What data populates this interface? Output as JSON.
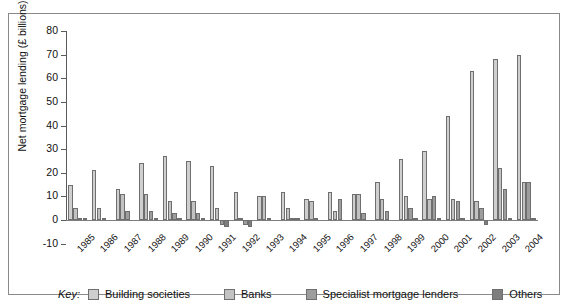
{
  "chart_data": {
    "type": "bar",
    "title": "",
    "xlabel": "",
    "ylabel": "Net mortgage lending (£ billions)",
    "ylim": [
      -10,
      80
    ],
    "yticks": [
      -10,
      0,
      10,
      20,
      30,
      40,
      50,
      60,
      70,
      80
    ],
    "ytick_labels": [
      "-10",
      "0",
      "10",
      "20",
      "30",
      "40",
      "50",
      "60",
      "70",
      "80"
    ],
    "grid": false,
    "legend_position": "bottom",
    "legend_title": "Key:",
    "categories": [
      "1985",
      "1986",
      "1987",
      "1988",
      "1989",
      "1990",
      "1991",
      "1992",
      "1993",
      "1994",
      "1995",
      "1996",
      "1997",
      "1998",
      "1999",
      "2000",
      "2001",
      "2002",
      "2003",
      "2004"
    ],
    "series": [
      {
        "name": "Building societies",
        "color": "#cfcfcf",
        "values": [
          15,
          21,
          13,
          24,
          27,
          25,
          23,
          12,
          10,
          12,
          9,
          12,
          11,
          16,
          26,
          29,
          44,
          63,
          68,
          70
        ]
      },
      {
        "name": "Banks",
        "color": "#c2c2c2",
        "values": [
          5,
          5,
          11,
          11,
          8,
          8,
          5,
          1,
          10,
          5,
          8,
          4,
          11,
          9,
          10,
          9,
          9,
          8,
          22,
          16
        ]
      },
      {
        "name": "Specialist mortgage lenders",
        "color": "#9d9d9d",
        "values": [
          1,
          1,
          4,
          4,
          3,
          3,
          -2,
          -2,
          1,
          1,
          1,
          9,
          3,
          4,
          5,
          10,
          8,
          5,
          13,
          16
        ]
      },
      {
        "name": "Others",
        "color": "#7e7e7e",
        "values": [
          1,
          0,
          0,
          1,
          1,
          1,
          -3,
          -3,
          0,
          1,
          0,
          0,
          0,
          0,
          1,
          1,
          1,
          -2,
          1,
          1
        ]
      }
    ]
  },
  "legend": {
    "key_label": "Key:",
    "items": [
      {
        "label": "Building societies",
        "color": "#cfcfcf"
      },
      {
        "label": "Banks",
        "color": "#c2c2c2"
      },
      {
        "label": "Specialist mortgage lenders",
        "color": "#9d9d9d"
      },
      {
        "label": "Others",
        "color": "#7e7e7e"
      }
    ]
  }
}
